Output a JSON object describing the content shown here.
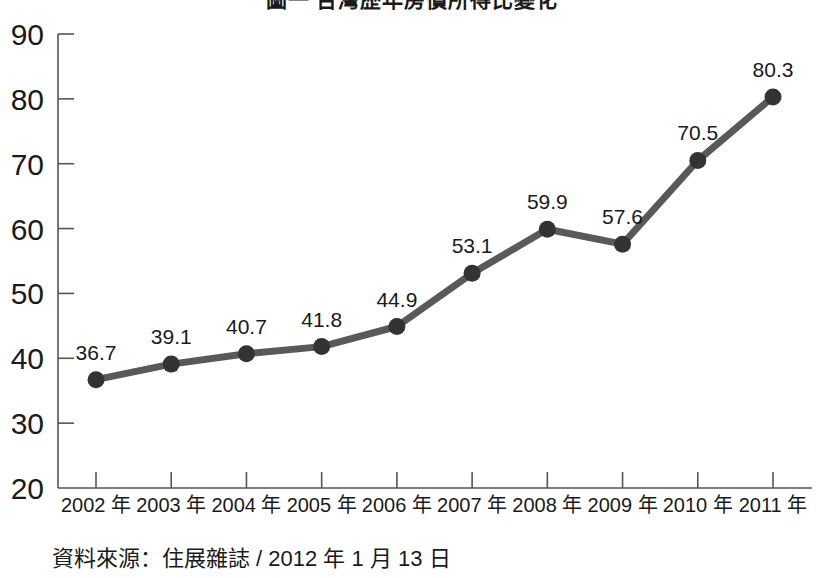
{
  "chart_data": {
    "type": "line",
    "title": "圖一 台灣歷年房價所得比變化",
    "categories": [
      "2002 年",
      "2003 年",
      "2004 年",
      "2005 年",
      "2006 年",
      "2007 年",
      "2008 年",
      "2009 年",
      "2010 年",
      "2011 年"
    ],
    "x": [
      2002,
      2003,
      2004,
      2005,
      2006,
      2007,
      2008,
      2009,
      2010,
      2011
    ],
    "values": [
      36.7,
      39.1,
      40.7,
      41.8,
      44.9,
      53.1,
      59.9,
      57.6,
      70.5,
      80.3
    ],
    "point_labels": [
      "36.7",
      "39.1",
      "40.7",
      "41.8",
      "44.9",
      "53.1",
      "59.9",
      "57.6",
      "70.5",
      "80.3"
    ],
    "xlabel": "",
    "ylabel": "",
    "ylim": [
      20,
      90
    ],
    "yticks": [
      20,
      30,
      40,
      50,
      60,
      70,
      80,
      90
    ],
    "ytick_labels": [
      "20",
      "30",
      "40",
      "50",
      "60",
      "70",
      "80",
      "90"
    ],
    "grid": false,
    "legend": false,
    "series_color": "#58595b",
    "marker_color": "#333333",
    "axis_color": "#555555",
    "marker": "circle",
    "line_width": 7,
    "marker_size": 17
  },
  "footer": {
    "source_note": "資料來源：住展雜誌 / 2012 年 1 月 13 日"
  }
}
